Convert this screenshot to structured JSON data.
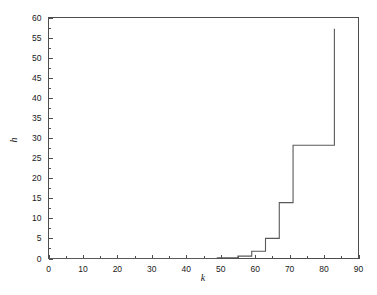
{
  "chart_data": {
    "type": "line",
    "title": "",
    "subtitle": "",
    "xlabel": "k",
    "ylabel": "h",
    "xlim": [
      0,
      90
    ],
    "ylim": [
      0,
      60
    ],
    "xticks": [
      0,
      10,
      20,
      30,
      40,
      50,
      60,
      70,
      80,
      90
    ],
    "yticks": [
      0,
      5,
      10,
      15,
      20,
      25,
      30,
      35,
      40,
      45,
      50,
      55,
      60
    ],
    "xtick_labels": [
      "0",
      "10",
      "20",
      "30",
      "40",
      "50",
      "60",
      "70",
      "80",
      "90"
    ],
    "ytick_labels": [
      "0",
      "5",
      "10",
      "15",
      "20",
      "25",
      "30",
      "35",
      "40",
      "45",
      "50",
      "55",
      "60"
    ],
    "minor_ticks": true,
    "grid": false,
    "legend": null,
    "legend_position": "none",
    "line_color": "#595959",
    "frame_color": "#4d4d4d",
    "background_color": "#ffffff",
    "series": [
      {
        "name": "h(k)",
        "style": "step-post",
        "x": [
          0,
          49,
          49,
          55,
          55,
          59,
          59,
          63,
          63,
          67,
          67,
          71,
          71,
          83,
          83
        ],
        "y": [
          0,
          0,
          0.2,
          0.2,
          0.6,
          0.6,
          1.8,
          1.8,
          5.0,
          5.0,
          13.9,
          13.9,
          28.2,
          28.2,
          57.2
        ]
      }
    ],
    "steps": [
      {
        "k_start": 0,
        "k_end": 49,
        "h": 0
      },
      {
        "k_start": 49,
        "k_end": 55,
        "h": 0.2
      },
      {
        "k_start": 55,
        "k_end": 59,
        "h": 0.6
      },
      {
        "k_start": 59,
        "k_end": 63,
        "h": 1.8
      },
      {
        "k_start": 63,
        "k_end": 67,
        "h": 5.0
      },
      {
        "k_start": 67,
        "k_end": 71,
        "h": 13.9
      },
      {
        "k_start": 71,
        "k_end": 83,
        "h": 28.2
      },
      {
        "k_start": 83,
        "k_end": 83,
        "h": 57.2
      }
    ],
    "peak": {
      "k": 83,
      "h": 57.2
    }
  }
}
